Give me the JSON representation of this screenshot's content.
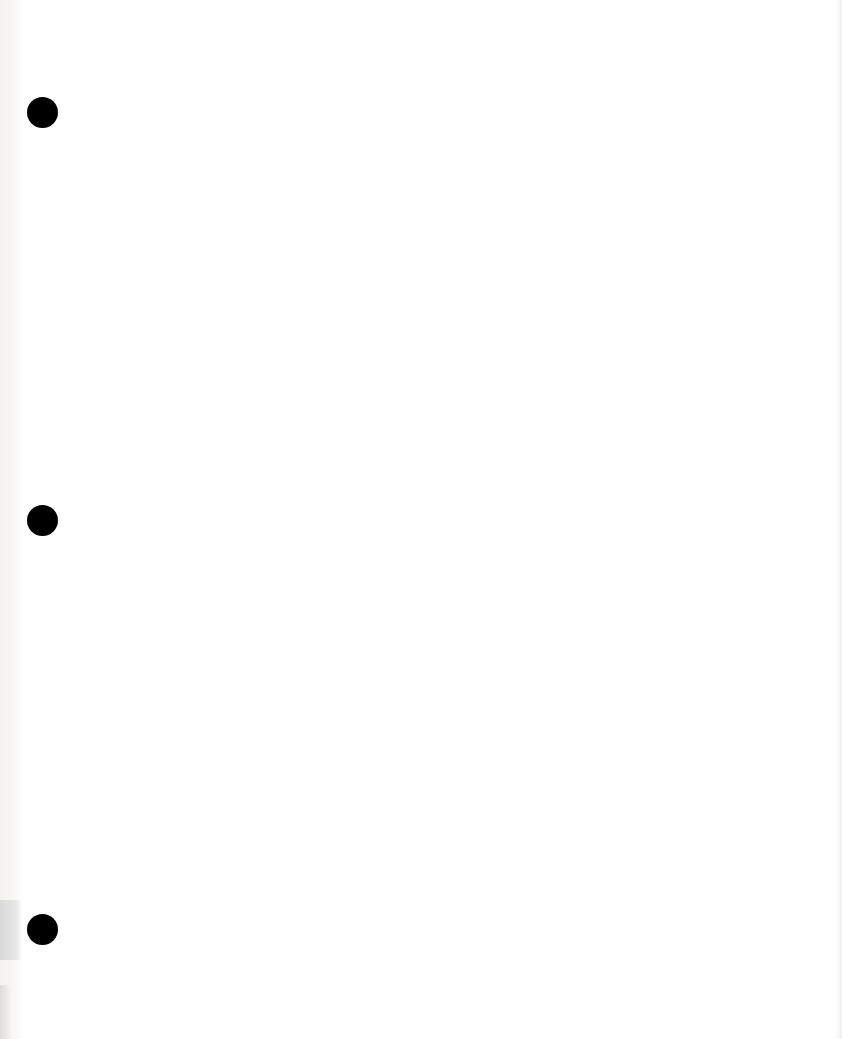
{
  "document": {
    "type": "blank scanned page",
    "text_content": "",
    "punch_holes": [
      {
        "cx": 42,
        "cy": 112,
        "diameter": 31
      },
      {
        "cx": 42,
        "cy": 520,
        "diameter": 31
      },
      {
        "cx": 42,
        "cy": 929,
        "diameter": 31
      }
    ],
    "colors": {
      "paper": "#fefefe",
      "hole": "#000000",
      "edge_shadow": "#d8d8d8"
    }
  }
}
